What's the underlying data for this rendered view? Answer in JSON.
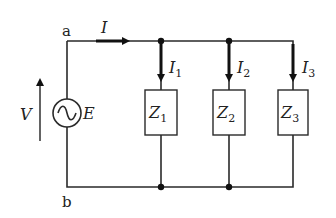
{
  "diagram": {
    "type": "circuit",
    "nodes": {
      "top": "a",
      "bottom": "b"
    },
    "source": {
      "label": "E",
      "symbol": "ac-source",
      "voltage_label": "V"
    },
    "main_current": {
      "symbol": "I"
    },
    "branches": [
      {
        "impedance": "Z",
        "impedance_sub": "1",
        "current": "I",
        "current_sub": "1"
      },
      {
        "impedance": "Z",
        "impedance_sub": "2",
        "current": "I",
        "current_sub": "2"
      },
      {
        "impedance": "Z",
        "impedance_sub": "3",
        "current": "I",
        "current_sub": "3"
      }
    ],
    "colors": {
      "wire": "#2a2a2a",
      "background": "#ffffff"
    }
  }
}
